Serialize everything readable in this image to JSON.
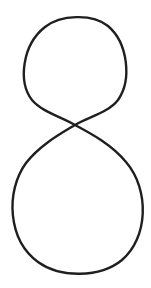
{
  "figure": {
    "stroke_color": "#1f1f1f",
    "background_color": "#ffffff"
  }
}
